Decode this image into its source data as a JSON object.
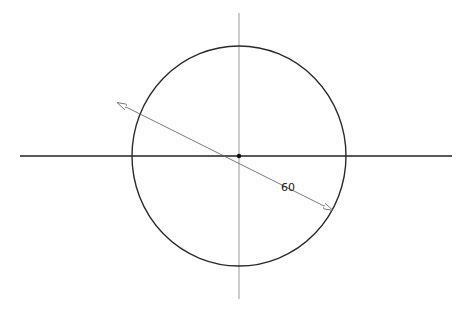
{
  "drawing": {
    "type": "circle-with-diameter-dimension",
    "center": {
      "x": 239,
      "y": 156
    },
    "radius_x": 107,
    "radius_y": 110,
    "horizontal_axis": {
      "x1": 20,
      "x2": 452,
      "y": 156
    },
    "vertical_axis": {
      "x": 239,
      "y1": 13,
      "y2": 299
    },
    "dimension": {
      "label": "60",
      "kind": "diameter",
      "start": {
        "x": 118,
        "y": 103
      },
      "end": {
        "x": 332,
        "y": 210
      }
    },
    "colors": {
      "circle": "#2a2a2a",
      "axis_h": "#222222",
      "axis_v": "#9a9a9a",
      "dimension_line": "#555555",
      "background": "#ffffff"
    }
  }
}
